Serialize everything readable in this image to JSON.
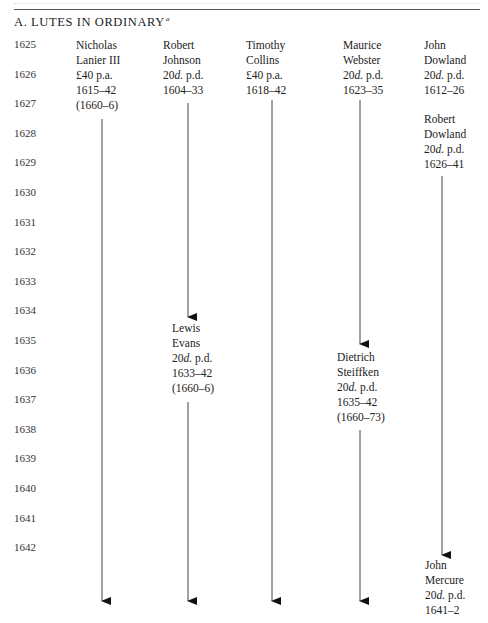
{
  "section": {
    "title": "A. LUTES IN ORDINARY",
    "footnote_mark": "a"
  },
  "years": [
    "1625",
    "1626",
    "1627",
    "1628",
    "1629",
    "1630",
    "1631",
    "1632",
    "1633",
    "1634",
    "1635",
    "1636",
    "1637",
    "1638",
    "1639",
    "1640",
    "1641",
    "1642"
  ],
  "entries": [
    {
      "name1": "Nicholas",
      "name2": "Lanier III",
      "pay": "£40 p.a.",
      "pay_unit": "",
      "dates": "1615–42",
      "extra": "(1660–6)"
    },
    {
      "name1": "Robert",
      "name2": "Johnson",
      "pay": "20",
      "pay_unit": "d.",
      "pay_rest": " p.d.",
      "dates": "1604–33"
    },
    {
      "name1": "Timothy",
      "name2": "Collins",
      "pay": "£40 p.a.",
      "dates": "1618–42"
    },
    {
      "name1": "Maurice",
      "name2": "Webster",
      "pay": "20",
      "pay_unit": "d.",
      "pay_rest": " p.d.",
      "dates": "1623–35"
    },
    {
      "name1": "John",
      "name2": "Dowland",
      "pay": "20",
      "pay_unit": "d.",
      "pay_rest": " p.d.",
      "dates": "1612–26"
    },
    {
      "name1": "Robert",
      "name2": "Dowland",
      "pay": "20",
      "pay_unit": "d.",
      "pay_rest": " p.d.",
      "dates": "1626–41"
    },
    {
      "name1": "Lewis",
      "name2": "Evans",
      "pay": "20",
      "pay_unit": "d.",
      "pay_rest": " p.d.",
      "dates": "1633–42",
      "extra": "(1660–6)"
    },
    {
      "name1": "Dietrich",
      "name2": "Steiffken",
      "pay": "20",
      "pay_unit": "d.",
      "pay_rest": " p.d.",
      "dates": "1635–42",
      "extra": "(1660–73)"
    },
    {
      "name1": "John",
      "name2": "Mercure",
      "pay": "20",
      "pay_unit": "d.",
      "pay_rest": " p.d.",
      "dates": "1641–2"
    }
  ]
}
